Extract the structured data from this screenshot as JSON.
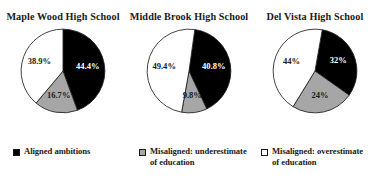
{
  "chart_data": {
    "type": "pie",
    "title": "",
    "legend_position": "bottom",
    "categories": [
      "Aligned ambitions",
      "Misaligned: underestimate of education",
      "Misaligned: overestimate of education"
    ],
    "colors": {
      "aligned": "#000000",
      "underestimate": "#a6a6a6",
      "overestimate": "#ffffff",
      "outline": "#1a1a1a"
    },
    "charts": [
      {
        "title": "Maple Wood High School",
        "start_angle_deg": 0,
        "slices": [
          {
            "category": "Aligned ambitions",
            "label": "44.4%",
            "value": 44.4,
            "color": "#000000",
            "text_color": "#ffffff"
          },
          {
            "category": "Misaligned: underestimate of education",
            "label": "16.7%",
            "value": 16.7,
            "color": "#a6a6a6",
            "text_color": "#1a1a1a"
          },
          {
            "category": "Misaligned: overestimate of education",
            "label": "38.9%",
            "value": 38.9,
            "color": "#ffffff",
            "text_color": "#1a1a1a"
          }
        ]
      },
      {
        "title": "Middle Brook High School",
        "start_angle_deg": 8,
        "slices": [
          {
            "category": "Aligned ambitions",
            "label": "40.8%",
            "value": 40.8,
            "color": "#000000",
            "text_color": "#ffffff"
          },
          {
            "category": "Misaligned: underestimate of education",
            "label": "9.8%",
            "value": 9.8,
            "color": "#a6a6a6",
            "text_color": "#1a1a1a"
          },
          {
            "category": "Misaligned: overestimate of education",
            "label": "49.4%",
            "value": 49.4,
            "color": "#ffffff",
            "text_color": "#1a1a1a"
          }
        ]
      },
      {
        "title": "Del Vista High School",
        "start_angle_deg": 10,
        "slices": [
          {
            "category": "Aligned ambitions",
            "label": "32%",
            "value": 32,
            "color": "#000000",
            "text_color": "#ffffff"
          },
          {
            "category": "Misaligned: underestimate of education",
            "label": "24%",
            "value": 24,
            "color": "#a6a6a6",
            "text_color": "#1a1a1a"
          },
          {
            "category": "Misaligned: overestimate of education",
            "label": "44%",
            "value": 44,
            "color": "#ffffff",
            "text_color": "#1a1a1a"
          }
        ]
      }
    ],
    "legend": [
      {
        "swatch": "#000000",
        "line1": "Aligned ambitions",
        "line2": ""
      },
      {
        "swatch": "#a6a6a6",
        "line1": "Misaligned: underestimate",
        "line2": "of education"
      },
      {
        "swatch": "#ffffff",
        "line1": "Misaligned: overestimate",
        "line2": "of education"
      }
    ]
  }
}
